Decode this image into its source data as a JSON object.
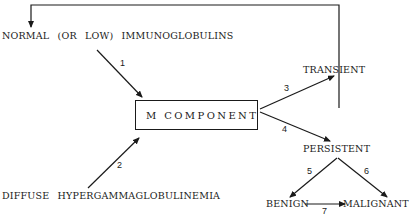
{
  "diagram": {
    "nodes": {
      "normal": "NORMAL  (OR  LOW)  IMMUNOGLOBULINS",
      "diffuse": "DIFFUSE  HYPERGAMMAGLOBULINEMIA",
      "m_component": "M   COMPONENT",
      "transient": "TRANSIENT",
      "persistent": "PERSISTENT",
      "benign": "BENIGN",
      "malignant": "MALIGNANT"
    },
    "edges": [
      {
        "label": "1",
        "from": "NORMAL (OR LOW) IMMUNOGLOBULINS",
        "to": "M COMPONENT"
      },
      {
        "label": "2",
        "from": "DIFFUSE HYPERGAMMAGLOBULINEMIA",
        "to": "M COMPONENT"
      },
      {
        "label": "3",
        "from": "M COMPONENT",
        "to": "TRANSIENT"
      },
      {
        "label": "4",
        "from": "M COMPONENT",
        "to": "PERSISTENT"
      },
      {
        "label": "5",
        "from": "PERSISTENT",
        "to": "BENIGN"
      },
      {
        "label": "6",
        "from": "PERSISTENT",
        "to": "MALIGNANT"
      },
      {
        "label": "7",
        "from": "BENIGN",
        "to": "MALIGNANT"
      },
      {
        "label": "",
        "from": "TRANSIENT",
        "to": "NORMAL (OR LOW) IMMUNOGLOBULINS"
      }
    ]
  }
}
